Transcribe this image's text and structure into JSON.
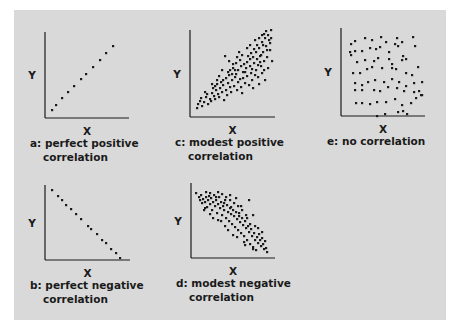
{
  "chart_data": [
    {
      "id": "a",
      "type": "scatter",
      "caption": [
        "a: perfect positive",
        "correlation"
      ],
      "xlabel": "X",
      "ylabel": "Y",
      "axis": {
        "ox": 45,
        "oy": 118,
        "top": 32,
        "right": 129
      },
      "points": [
        [
          52,
          110
        ],
        [
          56,
          105
        ],
        [
          62,
          98
        ],
        [
          68,
          92
        ],
        [
          74,
          86
        ],
        [
          81,
          79
        ],
        [
          86,
          74
        ],
        [
          93,
          67
        ],
        [
          100,
          60
        ],
        [
          106,
          53
        ],
        [
          113,
          46
        ]
      ]
    },
    {
      "id": "b",
      "type": "scatter",
      "caption": [
        "b: perfect negative",
        "correlation"
      ],
      "xlabel": "X",
      "ylabel": "Y",
      "axis": {
        "ox": 45,
        "oy": 260,
        "top": 185,
        "right": 130
      },
      "points": [
        [
          52,
          190
        ],
        [
          58,
          196
        ],
        [
          62,
          200
        ],
        [
          66,
          205
        ],
        [
          71,
          209
        ],
        [
          76,
          214
        ],
        [
          81,
          219
        ],
        [
          88,
          226
        ],
        [
          91,
          229
        ],
        [
          97,
          234
        ],
        [
          102,
          240
        ],
        [
          106,
          243
        ],
        [
          111,
          249
        ],
        [
          116,
          253
        ],
        [
          120,
          258
        ]
      ]
    },
    {
      "id": "c",
      "type": "scatter",
      "caption": [
        "c: modest positive",
        "correlation"
      ],
      "xlabel": "X",
      "ylabel": "Y",
      "axis": {
        "ox": 190,
        "oy": 117,
        "top": 30,
        "right": 275
      },
      "points": [
        [
          197,
          108
        ],
        [
          198,
          104
        ],
        [
          200,
          101
        ],
        [
          202,
          106
        ],
        [
          201,
          98
        ],
        [
          204,
          102
        ],
        [
          206,
          97
        ],
        [
          208,
          104
        ],
        [
          207,
          94
        ],
        [
          210,
          99
        ],
        [
          212,
          93
        ],
        [
          211,
          101
        ],
        [
          214,
          96
        ],
        [
          216,
          90
        ],
        [
          215,
          99
        ],
        [
          218,
          94
        ],
        [
          220,
          88
        ],
        [
          219,
          97
        ],
        [
          222,
          92
        ],
        [
          223,
          85
        ],
        [
          224,
          100
        ],
        [
          226,
          90
        ],
        [
          228,
          83
        ],
        [
          227,
          95
        ],
        [
          230,
          87
        ],
        [
          232,
          80
        ],
        [
          231,
          92
        ],
        [
          234,
          86
        ],
        [
          235,
          77
        ],
        [
          237,
          90
        ],
        [
          238,
          82
        ],
        [
          236,
          74
        ],
        [
          240,
          79
        ],
        [
          241,
          87
        ],
        [
          243,
          72
        ],
        [
          242,
          93
        ],
        [
          245,
          83
        ],
        [
          246,
          68
        ],
        [
          247,
          76
        ],
        [
          249,
          85
        ],
        [
          250,
          66
        ],
        [
          251,
          73
        ],
        [
          252,
          80
        ],
        [
          254,
          63
        ],
        [
          253,
          88
        ],
        [
          256,
          70
        ],
        [
          257,
          59
        ],
        [
          258,
          77
        ],
        [
          259,
          84
        ],
        [
          260,
          56
        ],
        [
          261,
          66
        ],
        [
          262,
          73
        ],
        [
          263,
          52
        ],
        [
          264,
          61
        ],
        [
          265,
          80
        ],
        [
          266,
          46
        ],
        [
          267,
          57
        ],
        [
          268,
          68
        ],
        [
          269,
          40
        ],
        [
          270,
          50
        ],
        [
          271,
          30
        ],
        [
          268,
          35
        ],
        [
          265,
          38
        ],
        [
          262,
          42
        ],
        [
          259,
          48
        ],
        [
          256,
          52
        ],
        [
          253,
          57
        ],
        [
          250,
          59
        ],
        [
          247,
          62
        ],
        [
          244,
          64
        ],
        [
          241,
          66
        ],
        [
          238,
          70
        ],
        [
          235,
          70
        ],
        [
          232,
          74
        ],
        [
          229,
          75
        ],
        [
          226,
          78
        ],
        [
          223,
          80
        ],
        [
          221,
          82
        ],
        [
          219,
          76
        ],
        [
          217,
          84
        ],
        [
          215,
          86
        ],
        [
          213,
          88
        ],
        [
          225,
          56
        ],
        [
          229,
          61
        ],
        [
          233,
          64
        ],
        [
          237,
          57
        ],
        [
          222,
          70
        ],
        [
          217,
          80
        ],
        [
          212,
          84
        ],
        [
          205,
          92
        ],
        [
          262,
          35
        ],
        [
          266,
          31
        ],
        [
          270,
          43
        ],
        [
          272,
          61
        ],
        [
          271,
          38
        ],
        [
          267,
          50
        ],
        [
          263,
          45
        ],
        [
          260,
          62
        ],
        [
          257,
          45
        ],
        [
          254,
          49
        ],
        [
          251,
          53
        ],
        [
          248,
          56
        ],
        [
          245,
          72
        ],
        [
          243,
          78
        ],
        [
          240,
          60
        ],
        [
          236,
          63
        ],
        [
          233,
          68
        ],
        [
          230,
          70
        ],
        [
          228,
          72
        ],
        [
          252,
          69
        ],
        [
          255,
          75
        ],
        [
          258,
          65
        ],
        [
          261,
          55
        ],
        [
          264,
          70
        ],
        [
          247,
          48
        ],
        [
          242,
          55
        ],
        [
          239,
          52
        ],
        [
          250,
          45
        ],
        [
          255,
          40
        ],
        [
          259,
          38
        ],
        [
          264,
          34
        ]
      ]
    },
    {
      "id": "d",
      "type": "scatter",
      "caption": [
        "d: modest negative",
        "correlation"
      ],
      "xlabel": "X",
      "ylabel": "Y",
      "axis": {
        "ox": 191,
        "oy": 258,
        "top": 183,
        "right": 275
      },
      "points": [
        [
          196,
          193
        ],
        [
          199,
          197
        ],
        [
          201,
          195
        ],
        [
          203,
          199
        ],
        [
          205,
          202
        ],
        [
          202,
          203
        ],
        [
          206,
          197
        ],
        [
          208,
          200
        ],
        [
          210,
          204
        ],
        [
          207,
          207
        ],
        [
          211,
          198
        ],
        [
          213,
          202
        ],
        [
          215,
          206
        ],
        [
          212,
          210
        ],
        [
          216,
          200
        ],
        [
          218,
          204
        ],
        [
          220,
          208
        ],
        [
          217,
          213
        ],
        [
          221,
          202
        ],
        [
          219,
          197
        ],
        [
          223,
          206
        ],
        [
          224,
          210
        ],
        [
          222,
          215
        ],
        [
          225,
          200
        ],
        [
          227,
          205
        ],
        [
          228,
          212
        ],
        [
          226,
          218
        ],
        [
          230,
          208
        ],
        [
          231,
          214
        ],
        [
          229,
          221
        ],
        [
          233,
          210
        ],
        [
          234,
          216
        ],
        [
          232,
          224
        ],
        [
          236,
          212
        ],
        [
          237,
          219
        ],
        [
          235,
          227
        ],
        [
          239,
          216
        ],
        [
          240,
          222
        ],
        [
          238,
          230
        ],
        [
          242,
          218
        ],
        [
          243,
          225
        ],
        [
          241,
          233
        ],
        [
          245,
          221
        ],
        [
          246,
          228
        ],
        [
          244,
          236
        ],
        [
          248,
          226
        ],
        [
          249,
          232
        ],
        [
          247,
          240
        ],
        [
          251,
          229
        ],
        [
          252,
          236
        ],
        [
          250,
          244
        ],
        [
          254,
          233
        ],
        [
          255,
          240
        ],
        [
          253,
          247
        ],
        [
          257,
          237
        ],
        [
          258,
          243
        ],
        [
          256,
          250
        ],
        [
          260,
          240
        ],
        [
          261,
          246
        ],
        [
          263,
          244
        ],
        [
          264,
          249
        ],
        [
          266,
          248
        ],
        [
          267,
          252
        ],
        [
          262,
          238
        ],
        [
          259,
          234
        ],
        [
          250,
          224
        ],
        [
          246,
          215
        ],
        [
          242,
          210
        ],
        [
          238,
          206
        ],
        [
          234,
          203
        ],
        [
          230,
          200
        ],
        [
          226,
          197
        ],
        [
          222,
          194
        ],
        [
          218,
          192
        ],
        [
          214,
          195
        ],
        [
          210,
          193
        ],
        [
          206,
          192
        ],
        [
          249,
          200
        ],
        [
          253,
          215
        ],
        [
          244,
          242
        ],
        [
          233,
          235
        ],
        [
          225,
          226
        ],
        [
          218,
          220
        ],
        [
          210,
          214
        ],
        [
          205,
          208
        ],
        [
          241,
          206
        ],
        [
          236,
          198
        ],
        [
          230,
          195
        ],
        [
          258,
          228
        ],
        [
          262,
          232
        ],
        [
          265,
          241
        ],
        [
          255,
          226
        ],
        [
          247,
          218
        ],
        [
          239,
          213
        ],
        [
          231,
          207
        ],
        [
          224,
          203
        ],
        [
          216,
          197
        ],
        [
          209,
          196
        ],
        [
          200,
          200
        ],
        [
          204,
          210
        ],
        [
          213,
          218
        ],
        [
          221,
          221
        ],
        [
          228,
          230
        ],
        [
          237,
          237
        ],
        [
          245,
          245
        ],
        [
          253,
          249
        ]
      ]
    },
    {
      "id": "e",
      "type": "scatter",
      "caption": [
        "e: no correlation"
      ],
      "xlabel": "X",
      "ylabel": "Y",
      "axis": {
        "ox": 341,
        "oy": 116,
        "top": 28,
        "right": 425
      },
      "points": [
        [
          351,
          44
        ],
        [
          355,
          41
        ],
        [
          365,
          38
        ],
        [
          372,
          40
        ],
        [
          381,
          37
        ],
        [
          386,
          42
        ],
        [
          397,
          38
        ],
        [
          398,
          46
        ],
        [
          402,
          42
        ],
        [
          413,
          37
        ],
        [
          415,
          46
        ],
        [
          350,
          52
        ],
        [
          355,
          51
        ],
        [
          362,
          51
        ],
        [
          370,
          48
        ],
        [
          376,
          49
        ],
        [
          380,
          47
        ],
        [
          389,
          52
        ],
        [
          395,
          44
        ],
        [
          403,
          56
        ],
        [
          351,
          55
        ],
        [
          357,
          62
        ],
        [
          365,
          60
        ],
        [
          374,
          61
        ],
        [
          378,
          58
        ],
        [
          389,
          59
        ],
        [
          392,
          64
        ],
        [
          402,
          60
        ],
        [
          406,
          59
        ],
        [
          418,
          67
        ],
        [
          353,
          73
        ],
        [
          360,
          73
        ],
        [
          367,
          69
        ],
        [
          372,
          67
        ],
        [
          382,
          68
        ],
        [
          392,
          68
        ],
        [
          396,
          69
        ],
        [
          406,
          73
        ],
        [
          412,
          75
        ],
        [
          414,
          83
        ],
        [
          355,
          83
        ],
        [
          362,
          85
        ],
        [
          368,
          82
        ],
        [
          375,
          80
        ],
        [
          384,
          82
        ],
        [
          392,
          79
        ],
        [
          399,
          82
        ],
        [
          406,
          86
        ],
        [
          422,
          82
        ],
        [
          419,
          91
        ],
        [
          355,
          90
        ],
        [
          362,
          90
        ],
        [
          374,
          90
        ],
        [
          380,
          91
        ],
        [
          388,
          87
        ],
        [
          397,
          88
        ],
        [
          404,
          91
        ],
        [
          414,
          92
        ],
        [
          422,
          95
        ],
        [
          356,
          103
        ],
        [
          362,
          103
        ],
        [
          370,
          104
        ],
        [
          377,
          102
        ],
        [
          386,
          102
        ],
        [
          395,
          99
        ],
        [
          402,
          105
        ],
        [
          411,
          103
        ],
        [
          416,
          98
        ],
        [
          421,
          95
        ],
        [
          398,
          112
        ],
        [
          403,
          111
        ],
        [
          407,
          114
        ],
        [
          385,
          114
        ],
        [
          377,
          116
        ]
      ]
    }
  ],
  "colors": {
    "panel": "#d9d9d9",
    "ink": "#1a1a1a",
    "background": "#ffffff"
  }
}
